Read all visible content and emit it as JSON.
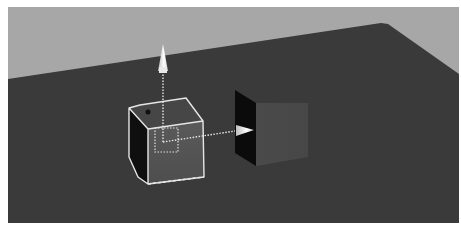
{
  "viewport": {
    "kind": "3d-perspective-viewport",
    "colors": {
      "sky": "#a7a7a7",
      "ground": "#3a3a3a",
      "cube_front": "#555555",
      "cube_top": "#444444",
      "cube_side": "#0e0e0e",
      "panel_front": "#4c4c4c",
      "panel_side": "#0a0a0a",
      "selection": "#e8e8e8",
      "gizmo": "#eeeeee"
    }
  },
  "scene": {
    "objects": [
      {
        "name": "cube",
        "selected": true
      },
      {
        "name": "panel",
        "selected": false
      }
    ],
    "gizmo": {
      "type": "translate",
      "axes": [
        "up",
        "right"
      ]
    }
  }
}
